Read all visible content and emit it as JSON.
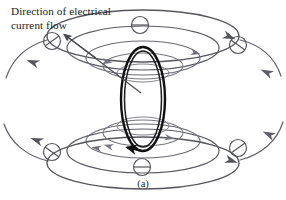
{
  "figure": {
    "caption": "(a)",
    "label": "Direction of electrical\ncurrent flow",
    "background_color": "#ffffff",
    "field_line_color": "#55565c",
    "field_line_color_light": "#7b7d84",
    "loop_color": "#111111",
    "leader_color": "#4a4b50",
    "marker_color": "#55565c",
    "text_color": "#1c1c1c"
  },
  "diagram": {
    "type": "magnetic-field-around-current-loop",
    "center": {
      "x": 143,
      "y": 100
    },
    "current_loop": {
      "cx": 143,
      "cy": 99,
      "rx": 22,
      "ry": 52,
      "stroke_width": 2.4,
      "inner_offset": 3,
      "arrow_label": "current-direction-arrow",
      "arrow_x": 128,
      "arrow_y": 146,
      "arrow_angle": 215
    },
    "upper_field_ellipses": [
      {
        "cx": 143,
        "cy": 36,
        "rx": 96,
        "ry": 26
      },
      {
        "cx": 143,
        "cy": 48,
        "rx": 76,
        "ry": 22
      },
      {
        "cx": 143,
        "cy": 58,
        "rx": 57,
        "ry": 17
      },
      {
        "cx": 143,
        "cy": 66,
        "rx": 40,
        "ry": 13
      },
      {
        "cx": 143,
        "cy": 73,
        "rx": 26,
        "ry": 9
      }
    ],
    "lower_field_ellipses": [
      {
        "cx": 143,
        "cy": 163,
        "rx": 96,
        "ry": 26
      },
      {
        "cx": 143,
        "cy": 151,
        "rx": 76,
        "ry": 22
      },
      {
        "cx": 143,
        "cy": 141,
        "rx": 57,
        "ry": 17
      },
      {
        "cx": 143,
        "cy": 133,
        "rx": 40,
        "ry": 13
      },
      {
        "cx": 143,
        "cy": 126,
        "rx": 26,
        "ry": 9
      }
    ],
    "slashed_circles": [
      {
        "cx": 52,
        "cy": 41,
        "r": 8.5,
        "orientation": "slash",
        "name": "field-marker-top-left"
      },
      {
        "cx": 140,
        "cy": 25,
        "r": 8.5,
        "orientation": "horizontal",
        "name": "field-marker-top-center"
      },
      {
        "cx": 238,
        "cy": 45,
        "r": 8.5,
        "orientation": "slash",
        "name": "field-marker-top-right"
      },
      {
        "cx": 52,
        "cy": 152,
        "r": 8.5,
        "orientation": "slash",
        "name": "field-marker-bottom-left"
      },
      {
        "cx": 142,
        "cy": 167,
        "r": 8.5,
        "orientation": "horizontal",
        "name": "field-marker-bottom-center"
      },
      {
        "cx": 238,
        "cy": 148,
        "r": 8.5,
        "orientation": "slash",
        "name": "field-marker-bottom-right"
      }
    ],
    "arrow_markers": [
      {
        "x": 32,
        "y": 62,
        "angle": 200,
        "name": "flow-arrow-upper-left"
      },
      {
        "x": 230,
        "y": 37,
        "angle": 22,
        "name": "flow-arrow-upper-right"
      },
      {
        "x": 36,
        "y": 140,
        "angle": 200,
        "name": "flow-arrow-lower-left"
      },
      {
        "x": 232,
        "y": 161,
        "angle": 18,
        "name": "flow-arrow-lower-right"
      },
      {
        "x": 266,
        "y": 72,
        "angle": 205,
        "name": "return-arrow-right-upper"
      },
      {
        "x": 268,
        "y": 134,
        "angle": 205,
        "name": "return-arrow-right-lower"
      },
      {
        "x": 108,
        "y": 62,
        "angle": 10,
        "name": "inner-arrow-upper"
      },
      {
        "x": 170,
        "y": 138,
        "angle": 10,
        "name": "inner-arrow-lower"
      },
      {
        "x": 108,
        "y": 146,
        "angle": 195,
        "name": "inner-arrow-lower-left"
      }
    ],
    "leader_arrows": [
      {
        "name": "leader-arrow-to-outer-line",
        "x1": 96,
        "y1": 58,
        "x2": 62,
        "y2": 33
      },
      {
        "name": "leader-arrow-to-loop",
        "x1": 140,
        "y1": 92,
        "x2": 62,
        "y2": 33
      }
    ]
  }
}
